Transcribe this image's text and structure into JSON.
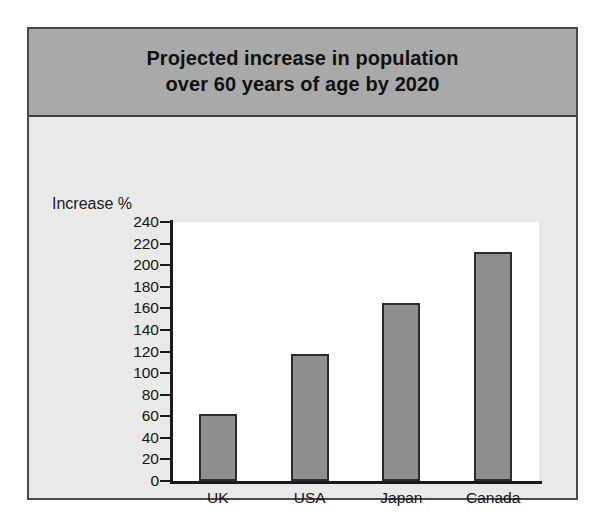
{
  "figure": {
    "title": "Projected increase in population\nover 60 years of age by 2020",
    "frame_color": "#4a4a4a",
    "banner_color": "#a9a9a9",
    "body_color": "#e9e9e9",
    "plot_background": "#ffffff"
  },
  "chart_data": {
    "type": "bar",
    "title": "Projected increase in population over 60 years of age by 2020",
    "categories": [
      "UK",
      "USA",
      "Japan",
      "Canada"
    ],
    "values": [
      62,
      118,
      165,
      212
    ],
    "xlabel": "",
    "ylabel": "Increase %",
    "ylim": [
      0,
      240
    ],
    "ytick_step": 20,
    "yticks": [
      0,
      20,
      40,
      60,
      80,
      100,
      120,
      140,
      160,
      180,
      200,
      220,
      240
    ],
    "ytick_labels": [
      "0",
      "20",
      "40",
      "60",
      "80",
      "100",
      "120",
      "140",
      "160",
      "180",
      "200",
      "220",
      "240"
    ],
    "grid": false,
    "legend": null,
    "bar_fill_color": "#8e8e8e",
    "bar_border_color": "#2c2c2c",
    "axis_color": "#1a1a1a"
  }
}
